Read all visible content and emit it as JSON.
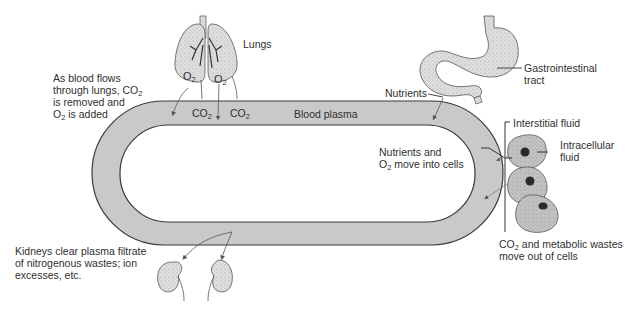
{
  "diagram": {
    "colors": {
      "plasma": "#c9c9c9",
      "outline": "#3a3a3a",
      "organ": "#dcdcdc",
      "cell": "#b8b8b8",
      "nucleus": "#2a2a2a"
    },
    "labels": {
      "lungs": "Lungs",
      "lungs_note_l1": "As blood flows",
      "lungs_note_l2": "through lungs, CO",
      "lungs_note_l3": "is removed and",
      "lungs_note_l4_pre": "O",
      "lungs_note_l4_post": " is added",
      "o2_left": "O",
      "o2_right": "O",
      "co2_a": "CO",
      "co2_b": "CO",
      "sub2": "2",
      "blood_plasma": "Blood plasma",
      "gi_l1": "Gastrointestinal",
      "gi_l2": "tract",
      "nutrients": "Nutrients",
      "interstitial": "Interstitial fluid",
      "intracellular_l1": "Intracellular",
      "intracellular_l2": "fluid",
      "nutrients_into_l1": "Nutrients and",
      "nutrients_into_l2_pre": "O",
      "nutrients_into_l2_post": " move into cells",
      "wastes_l1_pre": "CO",
      "wastes_l1_post": " and metabolic wastes",
      "wastes_l2": "move out of cells",
      "kidneys_l1": "Kidneys clear plasma filtrate",
      "kidneys_l2": "of nitrogenous wastes; ion",
      "kidneys_l3": "excesses, etc."
    }
  }
}
